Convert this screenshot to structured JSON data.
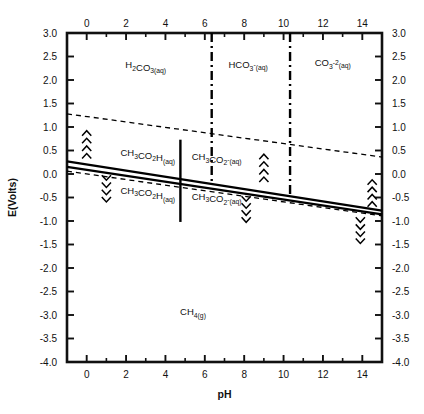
{
  "chart_data": {
    "type": "line",
    "title": "",
    "xlabel": "pH",
    "ylabel": "E(Volts)",
    "xlim": [
      -1,
      15
    ],
    "ylim": [
      -4.0,
      3.0
    ],
    "grid": false,
    "legend": "none",
    "x_ticks_major": [
      0,
      2,
      4,
      6,
      8,
      10,
      12,
      14
    ],
    "x_ticks_minor": [
      -1,
      1,
      3,
      5,
      7,
      9,
      11,
      13,
      15
    ],
    "x_tick_labels": [
      "0",
      "2",
      "4",
      "6",
      "8",
      "10",
      "12",
      "14"
    ],
    "y_ticks_major": [
      3.0,
      2.5,
      2.0,
      1.5,
      1.0,
      0.5,
      0.0,
      -0.5,
      -1.0,
      -1.5,
      -2.0,
      -2.5,
      -3.0,
      -3.5,
      -4.0
    ],
    "y_tick_labels": [
      "3.0",
      "2.5",
      "2.0",
      "1.5",
      "1.0",
      "0.5",
      "0.0",
      "-0.5",
      "-1.0",
      "-1.5",
      "-2.0",
      "-2.5",
      "-3.0",
      "-3.5",
      "-4.0"
    ],
    "axes_mirrored": {
      "top": true,
      "right": true
    },
    "series": [
      {
        "name": "water-oxidation-upper-dashed",
        "style": "dashed",
        "points": [
          [
            -1,
            1.28
          ],
          [
            15,
            0.36
          ]
        ]
      },
      {
        "name": "acetate-methane-solid-upper",
        "style": "solid",
        "points": [
          [
            -1,
            0.27
          ],
          [
            15,
            -0.78
          ]
        ]
      },
      {
        "name": "acetate-methane-solid-lower",
        "style": "solid",
        "points": [
          [
            -1,
            0.15
          ],
          [
            15,
            -0.86
          ]
        ]
      },
      {
        "name": "water-reduction-lower-dashed",
        "style": "dashed",
        "points": [
          [
            -1,
            0.06
          ],
          [
            15,
            -0.89
          ]
        ]
      }
    ],
    "vertical_lines": [
      {
        "name": "pka1-carbonic-acid",
        "ph": 6.35,
        "style": "dash-dot",
        "y_from": 3.0,
        "y_to": -0.2
      },
      {
        "name": "pka2-bicarbonate",
        "ph": 10.33,
        "style": "dash-dot",
        "y_from": 3.0,
        "y_to": -0.45
      },
      {
        "name": "pka-acetic-acid",
        "ph": 4.76,
        "style": "solid",
        "y_from": 0.73,
        "y_to": -1.02
      }
    ],
    "region_labels": [
      {
        "name": "carbonic-acid-region",
        "text": "H2CO3(aq)",
        "html": "H<sub>2</sub>CO<sub>3(aq)</sub>",
        "ph": 3.0,
        "e": 2.25
      },
      {
        "name": "bicarbonate-region",
        "text": "HCO3-(aq)",
        "html": "HCO<sub>3</sub><sup>-</sup><sub>(aq)</sub>",
        "ph": 8.2,
        "e": 2.25
      },
      {
        "name": "carbonate-region",
        "text": "CO3-2(aq)",
        "html": "CO<sub>3</sub><sup>-2</sup><sub>(aq)</sub>",
        "ph": 12.5,
        "e": 2.3
      },
      {
        "name": "acetic-acid-upper",
        "text": "CH3CO2H(aq)",
        "html": "CH<sub>3</sub>CO<sub>2</sub>H<sub>(aq)</sub>",
        "ph": 3.1,
        "e": 0.38
      },
      {
        "name": "acetate-upper",
        "text": "CH3CO2-(aq)",
        "html": "CH<sub>3</sub>CO<sub>2</sub><sup>-</sup><sub>(aq)</sub>",
        "ph": 6.6,
        "e": 0.3
      },
      {
        "name": "acetic-acid-lower",
        "text": "CH3CO2H(aq)",
        "html": "CH<sub>3</sub>CO<sub>2</sub>H<sub>(aq)</sub>",
        "ph": 3.1,
        "e": -0.42
      },
      {
        "name": "acetate-lower",
        "text": "CH3CO2-(aq)",
        "html": "CH<sub>3</sub>CO<sub>2</sub><sup>-</sup><sub>(aq)</sub>",
        "ph": 6.6,
        "e": -0.55
      },
      {
        "name": "methane-region",
        "text": "CH4(g)",
        "html": "CH<sub>4(g)</sub>",
        "ph": 5.4,
        "e": -3.0
      }
    ],
    "chevron_markers": [
      {
        "name": "chevron-up-ph0",
        "ph": 0.0,
        "direction": "up",
        "count": 4,
        "e_top": 0.95,
        "e_bottom": 0.3
      },
      {
        "name": "chevron-down-ph1",
        "ph": 1.0,
        "direction": "down",
        "count": 4,
        "e_top": 0.0,
        "e_bottom": -0.62
      },
      {
        "name": "chevron-up-ph9",
        "ph": 9.0,
        "direction": "up",
        "count": 4,
        "e_top": 0.45,
        "e_bottom": -0.2
      },
      {
        "name": "chevron-down-ph8",
        "ph": 8.1,
        "direction": "down",
        "count": 4,
        "e_top": -0.45,
        "e_bottom": -1.05
      },
      {
        "name": "chevron-up-ph14-5",
        "ph": 14.5,
        "direction": "up",
        "count": 4,
        "e_top": -0.1,
        "e_bottom": -0.72
      },
      {
        "name": "chevron-down-ph13-9",
        "ph": 13.9,
        "direction": "down",
        "count": 4,
        "e_top": -0.9,
        "e_bottom": -1.5
      }
    ]
  }
}
